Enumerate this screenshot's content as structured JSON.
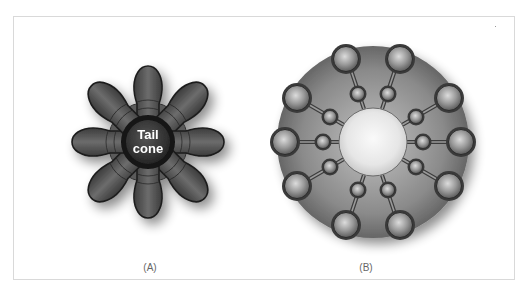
{
  "figure": {
    "panels": [
      {
        "id": "A",
        "caption": "(A)",
        "center_label_line1": "Tail",
        "center_label_line2": "cone",
        "lobe_count": 8,
        "description": "Eight-lobed daisy nozzle around a central tail cone"
      },
      {
        "id": "B",
        "caption": "(B)",
        "outer_nozzle_count": 12,
        "inner_nozzle_count": 12,
        "description": "Multi-tube nozzle arrangement on a circular disc with open center"
      }
    ]
  },
  "colors": {
    "frame_border": "#d9d9d9",
    "lobe_dark": "#3a3a3a",
    "lobe_mid": "#6a6a6a",
    "tail_cone": "#2e2e2e",
    "disc_mid": "#8a8a8a",
    "disc_edge": "#5a5a5a",
    "center_hole": "#f2f2f2",
    "caption_text": "#666666",
    "label_text": "#ffffff"
  }
}
